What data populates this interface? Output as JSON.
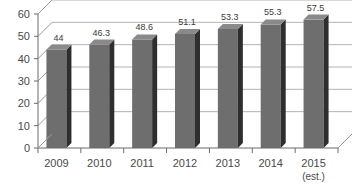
{
  "chart_data": {
    "type": "bar",
    "title": "",
    "subtitle": "",
    "xlabel": "",
    "ylabel": "",
    "ylim": [
      0,
      60
    ],
    "yticks": [
      0,
      10,
      20,
      30,
      40,
      50,
      60
    ],
    "ytick_labels": [
      "0",
      "10",
      "20",
      "30",
      "40",
      "50",
      "60"
    ],
    "grid": true,
    "legend": "none",
    "three_d": true,
    "categories": [
      "2009",
      "2010",
      "2011",
      "2012",
      "2013",
      "2014",
      "2015"
    ],
    "category_sublabels": [
      "",
      "",
      "",
      "",
      "",
      "",
      "(est.)"
    ],
    "values": [
      44,
      46.3,
      48.6,
      51.1,
      53.3,
      55.3,
      57.5
    ],
    "value_labels": [
      "44",
      "46.3",
      "48.6",
      "51.1",
      "53.3",
      "55.3",
      "57.5"
    ],
    "series": [
      {
        "name": "",
        "values": [
          44,
          46.3,
          48.6,
          51.1,
          53.3,
          55.3,
          57.5
        ]
      }
    ],
    "colors": {
      "bar_front": "#6e6e6e",
      "bar_side": "#2e2e2e",
      "bar_top": "#8a8a8a",
      "grid": "#b4b4b4",
      "axis": "#6b6b6b",
      "depth": "#9a9a9a",
      "text": "#4a4a4a",
      "background": "#ffffff"
    }
  }
}
